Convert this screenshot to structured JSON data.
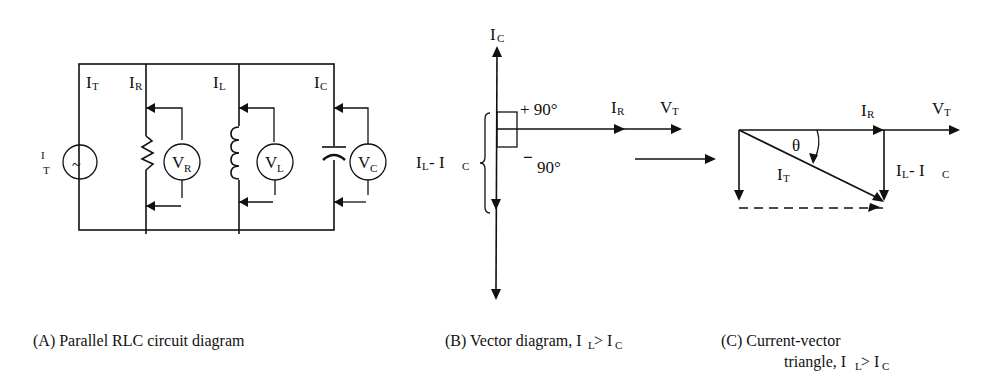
{
  "panel_a": {
    "caption": "(A)  Parallel RLC circuit diagram",
    "source_label": {
      "main": "I",
      "sub": "T"
    },
    "source_symbol": "~",
    "branch_labels": [
      {
        "main": "I",
        "sub": "T"
      },
      {
        "main": "I",
        "sub": "R"
      },
      {
        "main": "I",
        "sub": "L"
      },
      {
        "main": "I",
        "sub": "C"
      }
    ],
    "meters": [
      {
        "main": "V",
        "sub": "R"
      },
      {
        "main": "V",
        "sub": "L"
      },
      {
        "main": "V",
        "sub": "C"
      }
    ]
  },
  "panel_b": {
    "caption_main": "(B) Vector diagram, I",
    "caption_sub1": "L",
    "caption_mid": " > I",
    "caption_sub2": "C",
    "up_label": {
      "main": "I",
      "sub": "C"
    },
    "plus_angle": "+ 90°",
    "minus_sign": "−",
    "minus_angle": "90°",
    "diff_label": {
      "main": "I",
      "sub1": "L",
      "mid": " - I",
      "sub2": "C"
    },
    "ir_label": {
      "main": "I",
      "sub": "R"
    },
    "vt_label": {
      "main": "V",
      "sub": "T"
    }
  },
  "panel_c": {
    "caption_line1": "(C) Current-vector",
    "caption_line2_main": "triangle, I",
    "caption_line2_sub1": "L",
    "caption_line2_mid": " > I",
    "caption_line2_sub2": "C",
    "ir_label": {
      "main": "I",
      "sub": "R"
    },
    "vt_label": {
      "main": "V",
      "sub": "T"
    },
    "theta": "θ",
    "it_label": {
      "main": "I",
      "sub": "T"
    },
    "diff_label": {
      "main": "I",
      "sub1": "L",
      "mid": " - I",
      "sub2": "C"
    }
  }
}
